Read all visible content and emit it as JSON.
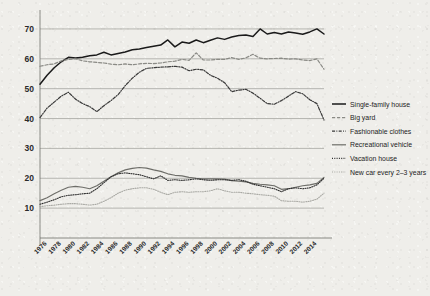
{
  "chart_data": {
    "type": "line",
    "title": "",
    "xlabel": "",
    "ylabel": "",
    "ylim": [
      0,
      75
    ],
    "yticks": [
      10,
      20,
      30,
      40,
      50,
      60,
      70
    ],
    "xlim": [
      1975,
      2015
    ],
    "grid": true,
    "legend_position": "right",
    "x": [
      1975,
      1976,
      1977,
      1978,
      1979,
      1980,
      1981,
      1982,
      1983,
      1984,
      1985,
      1986,
      1987,
      1988,
      1989,
      1990,
      1991,
      1992,
      1993,
      1994,
      1995,
      1996,
      1997,
      1998,
      1999,
      2000,
      2001,
      2002,
      2003,
      2004,
      2005,
      2006,
      2007,
      2008,
      2009,
      2010,
      2011,
      2012,
      2013,
      2014,
      2015
    ],
    "xtick_labels": [
      "1976",
      "1978",
      "1980",
      "1982",
      "1984",
      "1986",
      "1988",
      "1990",
      "1992",
      "1994",
      "1996",
      "1998",
      "2000",
      "2002",
      "2004",
      "2006",
      "2008",
      "2010",
      "2012",
      "2014"
    ],
    "xticks": [
      1976,
      1978,
      1980,
      1982,
      1984,
      1986,
      1988,
      1990,
      1992,
      1994,
      1996,
      1998,
      2000,
      2002,
      2004,
      2006,
      2008,
      2010,
      2012,
      2014
    ],
    "series": [
      {
        "name": "Single-family house",
        "style": "solid",
        "color": "#1a1a1a",
        "width": 1.5,
        "values": [
          51.5,
          54.5,
          57.0,
          59.0,
          60.5,
          60.3,
          60.5,
          61.0,
          61.3,
          62.2,
          61.3,
          61.8,
          62.3,
          63.0,
          63.3,
          63.8,
          64.2,
          64.6,
          66.3,
          64.0,
          65.6,
          65.2,
          66.3,
          65.4,
          66.2,
          67.0,
          66.5,
          67.3,
          67.8,
          68.0,
          67.5,
          70.0,
          68.3,
          68.8,
          68.3,
          69.0,
          68.6,
          68.2,
          69.0,
          70.0,
          68.3
        ]
      },
      {
        "name": "Big yard",
        "style": "dashed",
        "color": "#8a8a85",
        "width": 1.2,
        "values": [
          57.5,
          58.0,
          58.3,
          59.3,
          59.8,
          60.0,
          59.3,
          59.0,
          58.8,
          58.6,
          58.2,
          58.0,
          58.3,
          58.0,
          58.3,
          58.5,
          58.4,
          58.6,
          59.0,
          59.2,
          59.8,
          59.5,
          62.0,
          59.6,
          59.6,
          59.8,
          59.8,
          60.4,
          59.8,
          60.3,
          61.5,
          60.2,
          60.0,
          60.1,
          60.2,
          59.9,
          60.0,
          59.6,
          59.4,
          60.0,
          56.5
        ]
      },
      {
        "name": "Fashionable clothes",
        "style": "dashdot",
        "color": "#3a3a3a",
        "width": 1.2,
        "values": [
          40.3,
          43.5,
          45.5,
          47.5,
          48.8,
          46.5,
          45.0,
          44.0,
          42.3,
          44.3,
          46.0,
          48.0,
          51.0,
          53.5,
          55.5,
          56.8,
          57.0,
          57.2,
          57.3,
          57.5,
          57.2,
          56.0,
          56.5,
          56.3,
          54.5,
          53.5,
          52.0,
          49.0,
          49.5,
          49.8,
          48.5,
          46.8,
          45.0,
          44.8,
          46.0,
          47.5,
          49.0,
          48.3,
          46.3,
          45.0,
          39.5
        ]
      },
      {
        "name": "Recreational vehicle",
        "style": "solid",
        "color": "#6e6e69",
        "width": 1.2,
        "values": [
          12.5,
          13.5,
          14.8,
          16.0,
          17.0,
          17.3,
          17.0,
          16.5,
          17.5,
          19.0,
          20.5,
          21.8,
          22.8,
          23.3,
          23.6,
          23.4,
          22.8,
          22.3,
          21.5,
          21.0,
          20.8,
          20.3,
          20.0,
          19.8,
          19.8,
          19.8,
          19.7,
          19.2,
          19.0,
          18.8,
          18.3,
          18.0,
          17.8,
          17.5,
          16.3,
          16.5,
          17.0,
          17.5,
          17.8,
          18.3,
          20.3
        ]
      },
      {
        "name": "Vacation house",
        "style": "dotted",
        "color": "#2e2e2e",
        "width": 1.1,
        "values": [
          11.3,
          12.0,
          12.8,
          13.8,
          14.3,
          14.5,
          14.8,
          15.0,
          16.5,
          18.5,
          20.5,
          21.5,
          21.8,
          21.5,
          21.2,
          20.5,
          19.8,
          20.8,
          19.3,
          19.5,
          19.3,
          19.5,
          19.8,
          19.5,
          19.3,
          19.5,
          19.5,
          19.3,
          19.5,
          19.0,
          18.0,
          17.5,
          17.0,
          16.5,
          15.5,
          16.5,
          16.8,
          16.5,
          16.8,
          17.8,
          20.0
        ]
      },
      {
        "name": "New car every 2–3 years",
        "style": "dotted",
        "color": "#a9a9a4",
        "width": 1.1,
        "values": [
          10.5,
          10.8,
          11.0,
          11.3,
          11.5,
          11.5,
          11.3,
          11.0,
          11.3,
          12.3,
          13.5,
          15.0,
          16.0,
          16.5,
          16.8,
          16.8,
          16.3,
          15.3,
          14.5,
          15.3,
          15.5,
          15.3,
          15.5,
          15.5,
          15.8,
          16.5,
          15.8,
          15.3,
          15.3,
          15.0,
          14.8,
          14.5,
          14.3,
          14.0,
          12.5,
          12.3,
          12.3,
          12.0,
          12.3,
          13.0,
          15.0
        ]
      }
    ]
  },
  "legend": {
    "items": [
      {
        "label": "Single-family house"
      },
      {
        "label": "Big yard"
      },
      {
        "label": "Fashionable clothes"
      },
      {
        "label": "Recreational vehicle"
      },
      {
        "label": "Vacation house"
      },
      {
        "label": "New car every 2–3 years"
      }
    ]
  }
}
